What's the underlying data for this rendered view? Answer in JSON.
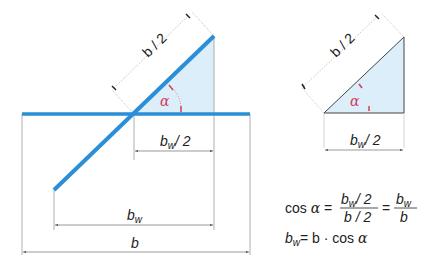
{
  "colors": {
    "beam": "#2a8fd6",
    "fill": "#dceefa",
    "angle": "#d0405a",
    "dim": "#555555"
  },
  "left_figure": {
    "dim_hyp": "b / 2",
    "dim_half_width": "2",
    "dim_width_base": "b",
    "dim_width_sub": "w",
    "dim_total": "b",
    "angle": "α"
  },
  "right_figure": {
    "dim_hyp": "b / 2",
    "dim_half_width": "2",
    "angle": "α"
  },
  "formulas": {
    "line1_cos": "cos",
    "line1_alpha": "α",
    "line1_eq": "=",
    "frac1_num": "/ 2",
    "frac1_den": "b / 2",
    "frac2_den": "b",
    "line2_eq": "= b · cos",
    "line2_alpha": "α",
    "b": "b",
    "w": "w"
  }
}
